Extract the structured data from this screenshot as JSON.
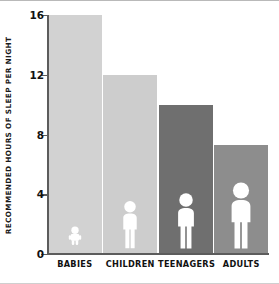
{
  "chart_data": {
    "type": "bar",
    "title": "",
    "subtitle": "",
    "xlabel": "",
    "ylabel": "RECOMMENDED HOURS OF SLEEP PER NIGHT",
    "categories": [
      "BABIES",
      "CHILDREN",
      "TEENAGERS",
      "ADULTS"
    ],
    "values": [
      16,
      12,
      10,
      7.3
    ],
    "ylim": [
      0,
      16
    ],
    "yticks": [
      0,
      4,
      8,
      12,
      16
    ],
    "ytick_labels": [
      "0",
      "4",
      "8",
      "12",
      "16"
    ],
    "grid": false,
    "legend": false,
    "series": [
      {
        "name": "Recommended hours of sleep per night",
        "values": [
          16,
          12,
          10,
          7.3
        ]
      }
    ],
    "bar_colors": [
      "#d2d2d2",
      "#cdcdcd",
      "#6f6f6f",
      "#8d8d8d"
    ],
    "icon_names": [
      "baby-figure-icon",
      "child-figure-icon",
      "teenager-figure-icon",
      "adult-figure-icon"
    ],
    "icon_color": "#ffffff",
    "axis_color": "#5c5c5c",
    "text_color": "#111111",
    "background_color": "#ffffff"
  }
}
